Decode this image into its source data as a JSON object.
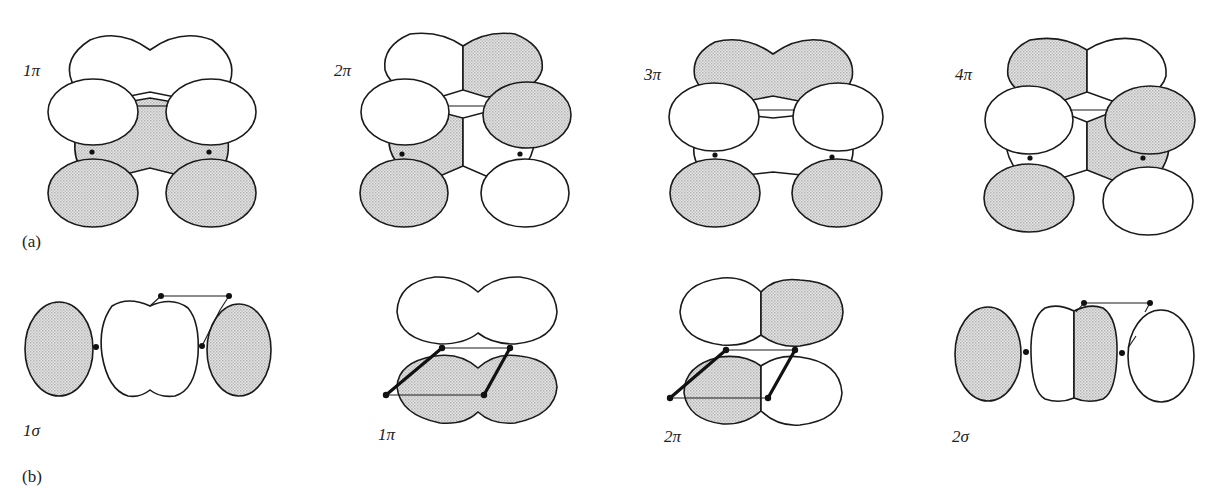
{
  "figure": {
    "panels": [
      {
        "id": "a",
        "label": "(a)",
        "orbitals": [
          {
            "label": "1π",
            "top_lobe": "white",
            "upper_left": "white",
            "upper_right": "white",
            "center": "shaded",
            "lower_left": "shaded",
            "lower_right": "shaded"
          },
          {
            "label": "2π",
            "top_left": "white",
            "top_right": "shaded",
            "upper_left": "white",
            "upper_right": "shaded",
            "center_left": "shaded",
            "center_right": "white",
            "lower_left": "shaded",
            "lower_right": "white"
          },
          {
            "label": "3π",
            "top_lobe": "shaded",
            "upper_left": "white",
            "upper_right": "white",
            "center": "white",
            "lower_left": "shaded",
            "lower_right": "shaded"
          },
          {
            "label": "4π",
            "top_left": "shaded",
            "top_right": "white",
            "upper_left": "white",
            "upper_right": "shaded",
            "center_left": "white",
            "center_right": "shaded",
            "lower_left": "shaded",
            "lower_right": "white"
          }
        ]
      },
      {
        "id": "b",
        "label": "(b)",
        "orbitals": [
          {
            "label": "1σ",
            "left_lobe": "shaded",
            "center_lobe": "white",
            "right_lobe": "shaded"
          },
          {
            "label": "1π",
            "top_lobe": "white",
            "bottom_lobe": "shaded"
          },
          {
            "label": "2π",
            "top_left": "white",
            "top_right": "shaded",
            "bottom_left": "shaded",
            "bottom_right": "white"
          },
          {
            "label": "2σ",
            "left_lobe": "shaded",
            "center_left": "white",
            "center_right": "shaded",
            "right_lobe": "white"
          }
        ]
      }
    ],
    "colors": {
      "shaded": "#d6d6d6",
      "white": "#ffffff",
      "outline": "#1a1a1a"
    }
  }
}
